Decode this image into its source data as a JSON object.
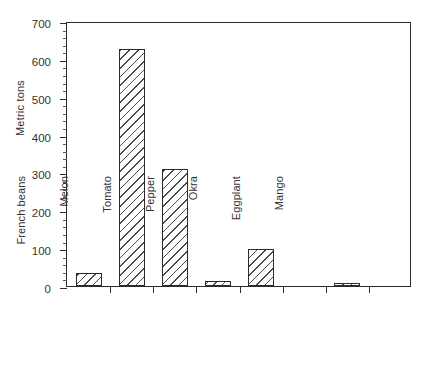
{
  "chart_data": {
    "type": "bar",
    "title": "",
    "xlabel": "",
    "ylabel": "Metric tons",
    "ylim": [
      0,
      700
    ],
    "ytick_step": 100,
    "yminor_step": 20,
    "grid": false,
    "legend": false,
    "categories": [
      "String beans",
      "French beans",
      "Melon",
      "Tomato",
      "Pepper",
      "Okra",
      "Eggplant",
      "Mango"
    ],
    "values": [
      34,
      626,
      308,
      14,
      97,
      0,
      6,
      0
    ],
    "ytick_labels": [
      "0",
      "100",
      "200",
      "300",
      "400",
      "500",
      "600",
      "700"
    ],
    "ytick_values": [
      0,
      100,
      200,
      300,
      400,
      500,
      600,
      700
    ],
    "bar_style": {
      "fill": "#ffffff",
      "hatch": "///",
      "hatch_color": "#4a4a4a",
      "edge_color": "#2b2b2b"
    },
    "axis_color": "#2b2b2b",
    "text_color": "#333333",
    "background": "#ffffff"
  }
}
